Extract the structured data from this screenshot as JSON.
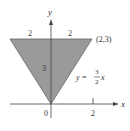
{
  "figure": {
    "axes": {
      "x_label": "x",
      "y_label": "y",
      "origin_label": "0",
      "x_tick_label": "2"
    },
    "region": {
      "vertices": [
        [
          -2,
          3
        ],
        [
          2,
          3
        ],
        [
          0,
          0
        ]
      ],
      "fill_color": "#9a9a9a",
      "edge_color": "#555555"
    },
    "annotations": {
      "top_left_width": "2",
      "top_right_width": "2",
      "height": "3",
      "corner_point": "(2,3)",
      "line_lhs": "y =",
      "line_num": "3",
      "line_den": "2",
      "line_var": "x"
    }
  }
}
